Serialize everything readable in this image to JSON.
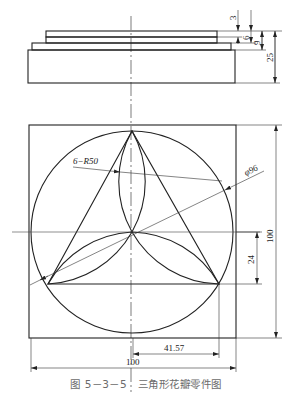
{
  "figure": {
    "caption": "图 5－3－5　三角形花瓣零件图",
    "title": "三角形花瓣零件图",
    "number": "图 5－3－5"
  },
  "side_view": {
    "name": "side-view",
    "dimensions": [
      {
        "label": "3",
        "orientation": "vertical"
      },
      {
        "label": "6",
        "orientation": "vertical"
      },
      {
        "label": "9",
        "orientation": "vertical"
      },
      {
        "label": "25",
        "orientation": "vertical"
      }
    ]
  },
  "top_view": {
    "name": "top-view",
    "annotations": {
      "radius": "6−R50",
      "diameter": "φ96"
    },
    "dimensions": {
      "height": "100",
      "offset": "24",
      "half_base": "41.57",
      "width": "100"
    }
  },
  "colors": {
    "line": "#222222",
    "thin_line": "#444444",
    "caption": "#6b6b6b"
  }
}
